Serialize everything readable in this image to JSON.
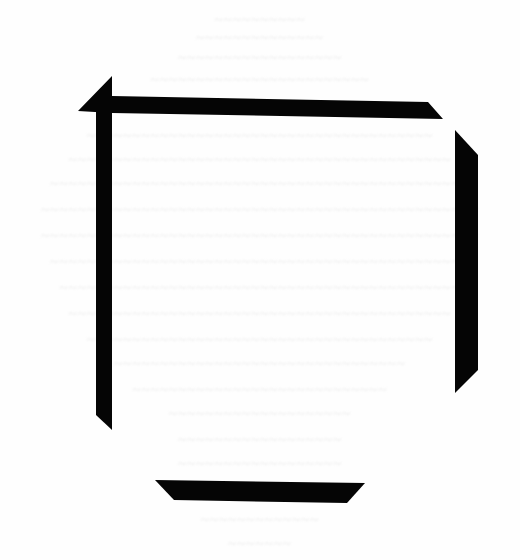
{
  "document": {
    "type": "scanned page with faint bleed-through text",
    "bleed_through_lines": [
      {
        "y": 12,
        "text": "~~~~~~~~~~"
      },
      {
        "y": 30,
        "text": "~~~~~~~~~~~~~~"
      },
      {
        "y": 50,
        "text": "~~~~~~~~~~~~~~~~~~"
      },
      {
        "y": 72,
        "text": "~~~~~~~~~~~~~~~~~~~~~~~~"
      },
      {
        "y": 128,
        "text": "~~~~~~~~~~~~~~~~~~~~~~~~~~~~~~~~~~~~~~"
      },
      {
        "y": 152,
        "text": "~~~~~~~~~~~~~~~~~~~~~~~~~~~~~~~~~~~~~~~~~~"
      },
      {
        "y": 176,
        "text": "~~~~~~~~~~~~~~~~~~~~~~~~~~~~~~~~~~~~~~~~~~~~~~"
      },
      {
        "y": 202,
        "text": "~~~~~~~~~~~~~~~~~~~~~~~~~~~~~~~~~~~~~~~~~~~~~~~~"
      },
      {
        "y": 228,
        "text": "~~~~~~~~~~~~~~~~~~~~~~~~~~~~~~~~~~~~~~~~~~~~~~~~"
      },
      {
        "y": 254,
        "text": "~~~~~~~~~~~~~~~~~~~~~~~~~~~~~~~~~~~~~~~~~~~~~~"
      },
      {
        "y": 280,
        "text": "~~~~~~~~~~~~~~~~~~~~~~~~~~~~~~~~~~~~~~~~~~~~"
      },
      {
        "y": 306,
        "text": "~~~~~~~~~~~~~~~~~~~~~~~~~~~~~~~~~~~~~~~~~~"
      },
      {
        "y": 332,
        "text": "~~~~~~~~~~~~~~~~~~~~~~~~~~~~~~~~~~~~~~"
      },
      {
        "y": 356,
        "text": "~~~~~~~~~~~~~~~~~~~~~~~~~~~~~~~~"
      },
      {
        "y": 382,
        "text": "~~~~~~~~~~~~~~~~~~~~~~~~~~~~"
      },
      {
        "y": 406,
        "text": "~~~~~~~~~~~~~~~~~~~~"
      },
      {
        "y": 432,
        "text": "~~~~~~~~~~~~~~~~~~"
      },
      {
        "y": 456,
        "text": "~~~~~~~~~~~~~~~~~~"
      },
      {
        "y": 512,
        "text": "~~~~~~~~~~~~~"
      },
      {
        "y": 536,
        "text": "~~~~~~~"
      }
    ],
    "frame_bars": {
      "color": "#050505",
      "top": "78,111 112,76 112,96 428,102 443,119 112,113",
      "left": "96,96 112,96 112,430 96,415",
      "right": "455,130 478,155 478,370 455,393",
      "bottom": "155,480 365,483 347,503 174,500"
    }
  }
}
